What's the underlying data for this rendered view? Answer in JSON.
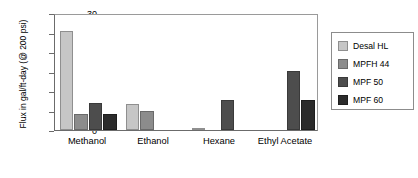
{
  "chart_data": {
    "type": "bar",
    "title": "",
    "xlabel": "",
    "ylabel": "Flux in gal/ft-day (@ 200 psi)",
    "ylim": [
      0,
      30
    ],
    "yticks": [
      0,
      5,
      10,
      15,
      20,
      25,
      30
    ],
    "grid": false,
    "legend_position": "right",
    "categories": [
      "Methanol",
      "Ethanol",
      "Hexane",
      "Ethyl Acetate"
    ],
    "series": [
      {
        "name": "Desal HL",
        "color": "#c6c6c6",
        "values": [
          25.3,
          6.6,
          0.5,
          null
        ]
      },
      {
        "name": "MPFH 44",
        "color": "#8c8c8c",
        "values": [
          4.0,
          5.0,
          null,
          null
        ]
      },
      {
        "name": "MPF 50",
        "color": "#4d4d4d",
        "values": [
          7.0,
          null,
          7.7,
          15.2
        ]
      },
      {
        "name": "MPF 60",
        "color": "#2b2b2b",
        "values": [
          4.2,
          null,
          null,
          7.6
        ]
      }
    ]
  },
  "legend": {
    "items": [
      {
        "label": "Desal HL"
      },
      {
        "label": "MPFH 44"
      },
      {
        "label": "MPF 50"
      },
      {
        "label": "MPF 60"
      }
    ]
  }
}
